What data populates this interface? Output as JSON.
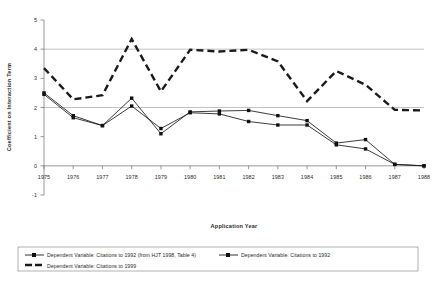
{
  "chart_data": {
    "type": "line",
    "title": "",
    "xlabel": "Application Year",
    "ylabel": "Coefficient on Interaction Term",
    "categories": [
      "1975",
      "1976",
      "1977",
      "1978",
      "1979",
      "1980",
      "1981",
      "1982",
      "1983",
      "1984",
      "1985",
      "1986",
      "1987",
      "1988"
    ],
    "xlim": [
      1975,
      1988
    ],
    "ylim": [
      -1,
      5
    ],
    "yticks": [
      "-1",
      "0",
      "1",
      "2",
      "3",
      "4",
      "5"
    ],
    "grid": "horizontal gridlines at y=2 and y=4",
    "legend_position": "below plot, bottom box",
    "series": [
      {
        "name": "Dependent Variable: Citations to 1992 (from HJT 1998, Table 4)",
        "marker": "square",
        "style": "solid-thin",
        "values": [
          2.45,
          1.65,
          1.38,
          2.05,
          1.28,
          1.82,
          1.78,
          1.52,
          1.4,
          1.4,
          0.72,
          0.58,
          0.05,
          0.0
        ]
      },
      {
        "name": "Dependent Variable: Citations to 1992",
        "marker": "square",
        "style": "solid-thin",
        "values": [
          2.5,
          1.72,
          1.38,
          2.32,
          1.1,
          1.85,
          1.88,
          1.9,
          1.72,
          1.55,
          0.78,
          0.9,
          0.05,
          0.0
        ]
      },
      {
        "name": "Dependent Variable: Citations to 1999",
        "marker": "none",
        "style": "bold-dashed",
        "values": [
          3.35,
          2.28,
          2.42,
          4.35,
          2.55,
          3.98,
          3.92,
          3.98,
          3.58,
          2.22,
          3.25,
          2.78,
          1.92,
          1.9
        ]
      }
    ]
  },
  "legend": {
    "entries": [
      {
        "label": "Dependent Variable: Citations to 1992 (from HJT 1998, Table 4)",
        "icon": "line-square-marker-icon"
      },
      {
        "label": "Dependent Variable: Citations to 1992",
        "icon": "line-square-marker-icon"
      },
      {
        "label": "Dependent Variable: Citations to 1999",
        "icon": "bold-dashed-line-icon"
      }
    ]
  },
  "axes": {
    "x_title": "Application Year",
    "y_title": "Coefficient on Interaction Term",
    "x_tick_labels": [
      "1975",
      "1976",
      "1977",
      "1978",
      "1979",
      "1980",
      "1981",
      "1982",
      "1983",
      "1984",
      "1985",
      "1986",
      "1987",
      "1988"
    ],
    "y_tick_labels": [
      "5",
      "4",
      "3",
      "2",
      "1",
      "0",
      "-1"
    ]
  },
  "colors": {
    "line": "#1a1a1a",
    "grid": "#9a9a9a",
    "axis": "#6e6e6e",
    "text": "#2b2b2b",
    "background": "#ffffff"
  }
}
